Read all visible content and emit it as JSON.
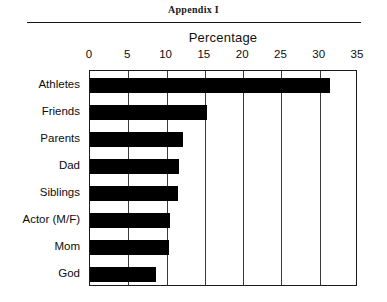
{
  "page": {
    "header_title": "Appendix I"
  },
  "chart_data": {
    "type": "bar",
    "orientation": "horizontal",
    "title": "Percentage",
    "xlabel": "Percentage",
    "ylabel": "",
    "xlim": [
      0,
      35
    ],
    "xticks": [
      0,
      5,
      10,
      15,
      20,
      25,
      30,
      35
    ],
    "xtick_labels": [
      "0",
      "5",
      "10",
      "15",
      "20",
      "25",
      "30",
      "35"
    ],
    "grid": true,
    "grid_axis": "x",
    "legend": false,
    "bar_color": "#000000",
    "plot_background": "#ffffff",
    "border_color": "#1b1b1b",
    "categories": [
      "Athletes",
      "Friends",
      "Parents",
      "Dad",
      "Siblings",
      "Actor (M/F)",
      "Mom",
      "God"
    ],
    "values": [
      31.3,
      15.3,
      12.1,
      11.6,
      11.5,
      10.4,
      10.3,
      8.6
    ]
  }
}
